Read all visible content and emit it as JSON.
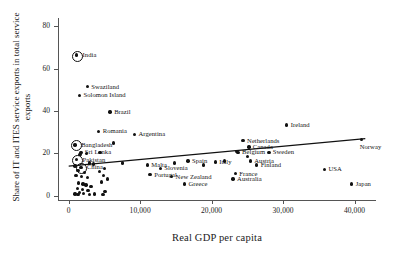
{
  "chart_data": {
    "type": "scatter",
    "title": "",
    "xlabel": "Real GDP per capita",
    "ylabel": "Share of IT and ITES service exports in total service exports",
    "xlim": [
      -1500,
      43000
    ],
    "ylim": [
      -2,
      84
    ],
    "xticks": [
      0,
      10000,
      20000,
      30000,
      40000
    ],
    "xtick_labels": [
      "0",
      "10,000",
      "20,000",
      "30,000",
      "40,000"
    ],
    "yticks": [
      0,
      20,
      40,
      60,
      80
    ],
    "ytick_labels": [
      "0",
      "20",
      "40",
      "60",
      "80"
    ],
    "grid": false,
    "legend": "none",
    "marker_color": "#111111",
    "trendline": {
      "label": "linear fit",
      "x0": 0,
      "y0": 14.0,
      "x1": 41500,
      "y1": 27.0
    },
    "points": [
      {
        "label": "India",
        "x": 1100,
        "y": 66.5,
        "highlight": true,
        "label_pos": "right"
      },
      {
        "label": "Swaziland",
        "x": 2600,
        "y": 51.5,
        "highlight": false,
        "label_pos": "right"
      },
      {
        "label": "Solomon Island",
        "x": 1500,
        "y": 47.5,
        "highlight": false,
        "label_pos": "right"
      },
      {
        "label": "Brazil",
        "x": 5800,
        "y": 39.5,
        "highlight": false,
        "label_pos": "right"
      },
      {
        "label": "Romania",
        "x": 4200,
        "y": 30.5,
        "highlight": false,
        "label_pos": "right"
      },
      {
        "label": "Argentina",
        "x": 9200,
        "y": 29.0,
        "highlight": false,
        "label_pos": "right"
      },
      {
        "label": "Bangladesh",
        "x": 900,
        "y": 24.0,
        "highlight": true,
        "label_pos": "right"
      },
      {
        "label": "Sri Lanka",
        "x": 1700,
        "y": 20.5,
        "highlight": false,
        "label_pos": "right"
      },
      {
        "label": "Pakistan",
        "x": 1100,
        "y": 17.0,
        "highlight": true,
        "label_pos": "right"
      },
      {
        "label": "China",
        "x": 1700,
        "y": 13.5,
        "highlight": true,
        "label_pos": "right"
      },
      {
        "label": "Ireland",
        "x": 30500,
        "y": 33.5,
        "highlight": false,
        "label_pos": "right"
      },
      {
        "label": "Netherlands",
        "x": 24400,
        "y": 26.0,
        "highlight": false,
        "label_pos": "right"
      },
      {
        "label": "Canada",
        "x": 25200,
        "y": 23.0,
        "highlight": false,
        "label_pos": "right"
      },
      {
        "label": "Belgium",
        "x": 23700,
        "y": 20.5,
        "highlight": false,
        "label_pos": "right"
      },
      {
        "label": "Sweden",
        "x": 28000,
        "y": 20.5,
        "highlight": false,
        "label_pos": "right"
      },
      {
        "label": "Austria",
        "x": 25400,
        "y": 16.5,
        "highlight": false,
        "label_pos": "right"
      },
      {
        "label": "Finland",
        "x": 26300,
        "y": 14.5,
        "highlight": false,
        "label_pos": "right"
      },
      {
        "label": "Norway",
        "x": 41000,
        "y": 26.5,
        "highlight": false,
        "label_pos": "below-right"
      },
      {
        "label": "USA",
        "x": 35800,
        "y": 12.5,
        "highlight": false,
        "label_pos": "right"
      },
      {
        "label": "Japan",
        "x": 39600,
        "y": 5.5,
        "highlight": false,
        "label_pos": "right"
      },
      {
        "label": "Spain",
        "x": 16700,
        "y": 16.5,
        "highlight": false,
        "label_pos": "right"
      },
      {
        "label": "Italy",
        "x": 20500,
        "y": 16.0,
        "highlight": false,
        "label_pos": "right"
      },
      {
        "label": "France",
        "x": 23300,
        "y": 10.5,
        "highlight": false,
        "label_pos": "right"
      },
      {
        "label": "Australia",
        "x": 23000,
        "y": 8.0,
        "highlight": false,
        "label_pos": "right"
      },
      {
        "label": "Malta",
        "x": 11000,
        "y": 14.5,
        "highlight": false,
        "label_pos": "right"
      },
      {
        "label": "Slovenia",
        "x": 12800,
        "y": 13.0,
        "highlight": false,
        "label_pos": "right"
      },
      {
        "label": "Portugal",
        "x": 11400,
        "y": 10.0,
        "highlight": false,
        "label_pos": "right"
      },
      {
        "label": "New Zealand",
        "x": 14400,
        "y": 9.0,
        "highlight": false,
        "label_pos": "right"
      },
      {
        "label": "Greece",
        "x": 16200,
        "y": 5.5,
        "highlight": false,
        "label_pos": "right"
      },
      {
        "label": "",
        "x": 6300,
        "y": 25.0,
        "highlight": false,
        "label_pos": "none"
      },
      {
        "label": "",
        "x": 4400,
        "y": 20.5,
        "highlight": false,
        "label_pos": "none"
      },
      {
        "label": "",
        "x": 2500,
        "y": 20.0,
        "highlight": false,
        "label_pos": "none"
      },
      {
        "label": "",
        "x": 1600,
        "y": 19.5,
        "highlight": false,
        "label_pos": "none"
      },
      {
        "label": "",
        "x": 2900,
        "y": 15.5,
        "highlight": false,
        "label_pos": "none"
      },
      {
        "label": "",
        "x": 3500,
        "y": 15.0,
        "highlight": false,
        "label_pos": "none"
      },
      {
        "label": "",
        "x": 900,
        "y": 14.0,
        "highlight": false,
        "label_pos": "none"
      },
      {
        "label": "",
        "x": 1300,
        "y": 12.0,
        "highlight": false,
        "label_pos": "none"
      },
      {
        "label": "",
        "x": 2200,
        "y": 11.0,
        "highlight": false,
        "label_pos": "none"
      },
      {
        "label": "",
        "x": 1000,
        "y": 9.5,
        "highlight": false,
        "label_pos": "none"
      },
      {
        "label": "",
        "x": 1800,
        "y": 9.0,
        "highlight": false,
        "label_pos": "none"
      },
      {
        "label": "",
        "x": 2600,
        "y": 8.5,
        "highlight": false,
        "label_pos": "none"
      },
      {
        "label": "",
        "x": 4900,
        "y": 9.5,
        "highlight": false,
        "label_pos": "none"
      },
      {
        "label": "",
        "x": 5400,
        "y": 8.0,
        "highlight": false,
        "label_pos": "none"
      },
      {
        "label": "",
        "x": 4600,
        "y": 6.5,
        "highlight": false,
        "label_pos": "none"
      },
      {
        "label": "",
        "x": 1400,
        "y": 6.0,
        "highlight": false,
        "label_pos": "none"
      },
      {
        "label": "",
        "x": 2000,
        "y": 5.5,
        "highlight": false,
        "label_pos": "none"
      },
      {
        "label": "",
        "x": 2400,
        "y": 5.0,
        "highlight": false,
        "label_pos": "none"
      },
      {
        "label": "",
        "x": 3100,
        "y": 4.5,
        "highlight": false,
        "label_pos": "none"
      },
      {
        "label": "",
        "x": 1200,
        "y": 3.5,
        "highlight": false,
        "label_pos": "none"
      },
      {
        "label": "",
        "x": 1900,
        "y": 3.0,
        "highlight": false,
        "label_pos": "none"
      },
      {
        "label": "",
        "x": 2700,
        "y": 2.5,
        "highlight": false,
        "label_pos": "none"
      },
      {
        "label": "",
        "x": 1500,
        "y": 1.5,
        "highlight": false,
        "label_pos": "none"
      },
      {
        "label": "",
        "x": 2100,
        "y": 1.0,
        "highlight": false,
        "label_pos": "none"
      },
      {
        "label": "",
        "x": 900,
        "y": 0.8,
        "highlight": false,
        "label_pos": "none"
      },
      {
        "label": "",
        "x": 1300,
        "y": 0.5,
        "highlight": false,
        "label_pos": "none"
      },
      {
        "label": "",
        "x": 2900,
        "y": 0.6,
        "highlight": false,
        "label_pos": "none"
      },
      {
        "label": "",
        "x": 3600,
        "y": 0.9,
        "highlight": false,
        "label_pos": "none"
      },
      {
        "label": "",
        "x": 4800,
        "y": 0.7,
        "highlight": false,
        "label_pos": "none"
      },
      {
        "label": "",
        "x": 5100,
        "y": 2.0,
        "highlight": false,
        "label_pos": "none"
      },
      {
        "label": "",
        "x": 4300,
        "y": 11.5,
        "highlight": false,
        "label_pos": "none"
      },
      {
        "label": "",
        "x": 5000,
        "y": 13.0,
        "highlight": false,
        "label_pos": "none"
      },
      {
        "label": "",
        "x": 7500,
        "y": 15.5,
        "highlight": false,
        "label_pos": "none"
      },
      {
        "label": "",
        "x": 14800,
        "y": 15.5,
        "highlight": false,
        "label_pos": "none"
      },
      {
        "label": "",
        "x": 18900,
        "y": 14.5,
        "highlight": false,
        "label_pos": "none"
      },
      {
        "label": "",
        "x": 25000,
        "y": 18.5,
        "highlight": false,
        "label_pos": "none"
      },
      {
        "label": "",
        "x": 23500,
        "y": 20.8,
        "highlight": false,
        "label_pos": "none"
      },
      {
        "label": "",
        "x": 21800,
        "y": 16.5,
        "highlight": false,
        "label_pos": "none"
      }
    ]
  }
}
